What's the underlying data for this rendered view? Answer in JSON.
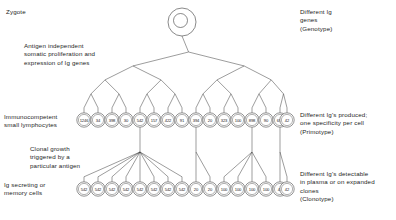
{
  "figure": {
    "background": "#ffffff",
    "line_color": "#3a3a3a",
    "text_color": "#1d1d1d"
  },
  "left_labels": {
    "zygote": "Zygote",
    "antigen_independent": "Antigen independent\nsomatic proliferation and\nexpression of Ig genes",
    "immunocompetent": "Immunocompetent\nsmall lymphocytes",
    "clonal_growth": "Clonal growth\ntriggered by a\nparticular antigen",
    "ig_secreting": "Ig secreting or\nmemory cells"
  },
  "right_labels": {
    "genotype": "Different Ig\ngenes\n(Genotype)",
    "primotype": "Different Ig's produced;\none specificity per cell\n(Primotype)",
    "clonotype": "Different Ig's detectable\nin plasma or on expanded\nclones\n(Clonotype)"
  },
  "zygote_cell": {
    "label": "",
    "cx": 182,
    "cy": 22,
    "r": 14,
    "nucleus_r": 7
  },
  "lymphocyte_row": {
    "cy": 120,
    "r": 7.2,
    "values": [
      "1246",
      "34",
      "398",
      "30",
      "542",
      "157",
      "422",
      "91",
      "394",
      "20",
      "323",
      "100",
      "898",
      "90",
      "690",
      "42"
    ],
    "x_positions": [
      84,
      98,
      112,
      126,
      140,
      154,
      168,
      182,
      196,
      210,
      224,
      238,
      252,
      266,
      280,
      287
    ]
  },
  "plasma_row": {
    "cy": 189,
    "r": 7.2,
    "values": [
      "542",
      "542",
      "542",
      "542",
      "542",
      "542",
      "542",
      "542",
      "20",
      "20",
      "100",
      "100",
      "100",
      "100",
      "42",
      "42"
    ],
    "x_positions": [
      84,
      98,
      112,
      126,
      140,
      154,
      168,
      182,
      196,
      210,
      224,
      238,
      252,
      266,
      280,
      287
    ]
  },
  "tree": {
    "root_x": 182,
    "root_y": 36,
    "generations": 4,
    "description": "binary branching tree from zygote down to 16 immunocompetent lymphocytes"
  }
}
